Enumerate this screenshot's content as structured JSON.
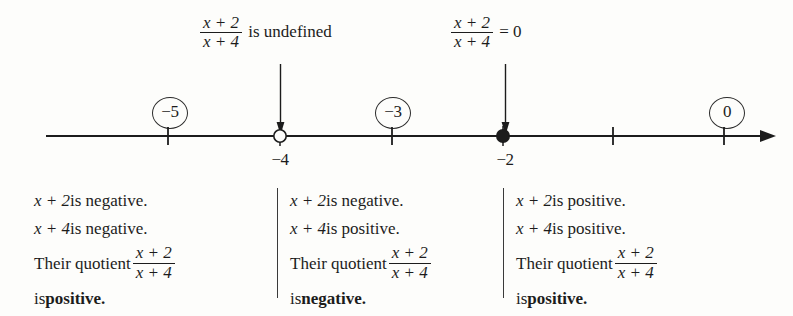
{
  "figure": {
    "expression": {
      "numerator": "x + 2",
      "denominator": "x + 4"
    },
    "callouts": [
      {
        "name": "undefined-at-neg4",
        "tail": " is undefined",
        "at": -4
      },
      {
        "name": "zero-at-neg2",
        "tail": " = 0",
        "at": -2
      }
    ],
    "number_line": {
      "tick_values": [
        "-5",
        "-4",
        "-3",
        "-2",
        "-1",
        "0"
      ],
      "axis_labels": [
        {
          "text": "−4",
          "value": -4
        },
        {
          "text": "−2",
          "value": -2
        }
      ],
      "points": [
        {
          "value": -4,
          "marker": "open-circle",
          "meaning": "undefined"
        },
        {
          "value": -2,
          "marker": "filled-circle",
          "meaning": "zero"
        }
      ],
      "arrow_direction": "right"
    },
    "test_values": [
      {
        "name": "test-value-neg5",
        "label": "−5"
      },
      {
        "name": "test-value-neg3",
        "label": "−3"
      },
      {
        "name": "test-value-0",
        "label": "0"
      }
    ],
    "intervals": [
      {
        "name": "interval-left",
        "line1_prefix": "x + 2",
        "line1_suffix": " is negative.",
        "line2_prefix": "x + 4",
        "line2_suffix": " is negative.",
        "line3": "Their quotient",
        "line4_prefix": "is ",
        "line4_sign": "positive."
      },
      {
        "name": "interval-middle",
        "line1_prefix": "x + 2",
        "line1_suffix": " is negative.",
        "line2_prefix": "x + 4",
        "line2_suffix": " is positive.",
        "line3": "Their quotient",
        "line4_prefix": "is ",
        "line4_sign": "negative."
      },
      {
        "name": "interval-right",
        "line1_prefix": "x + 2",
        "line1_suffix": " is positive.",
        "line2_prefix": "x + 4",
        "line2_suffix": " is positive.",
        "line3": "Their quotient",
        "line4_prefix": "is ",
        "line4_sign": "positive."
      }
    ],
    "colors": {
      "ink": "#1c1c1c",
      "background": "#fdfdfb",
      "rule": "#3a3a3a"
    }
  }
}
